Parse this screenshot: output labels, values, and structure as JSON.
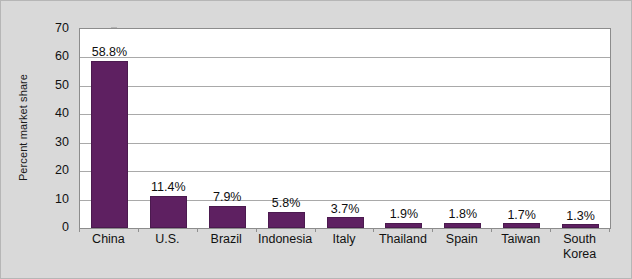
{
  "chart_data": {
    "type": "bar",
    "title": "",
    "xlabel": "",
    "ylabel": "Percent market share",
    "categories": [
      "China",
      "U.S.",
      "Brazil",
      "Indonesia",
      "Italy",
      "Thailand",
      "Spain",
      "Taiwan",
      "South Korea"
    ],
    "values": [
      58.8,
      11.4,
      7.9,
      5.8,
      3.7,
      1.9,
      1.8,
      1.7,
      1.3
    ],
    "data_labels": [
      "58.8%",
      "11.4%",
      "7.9%",
      "5.8%",
      "3.7%",
      "1.9%",
      "1.8%",
      "1.7%",
      "1.3%"
    ],
    "ylim": [
      0,
      70
    ],
    "yticks": [
      0,
      10,
      20,
      30,
      40,
      50,
      60,
      70
    ],
    "ytick_labels": [
      "0",
      "10",
      "20",
      "30",
      "40",
      "50",
      "60",
      "70"
    ],
    "grid": true,
    "legend": "none",
    "series_color": "#5e2061",
    "plot_background": "#ffffff",
    "figure_background": "#d9d9d9",
    "gridline_color": "#a9a9a9",
    "axis_color": "#8c8c8c"
  }
}
